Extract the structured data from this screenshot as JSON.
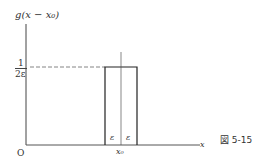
{
  "diagram": {
    "ylabel": "g(x − x₀)",
    "xlabel": "x",
    "origin": "O",
    "height_label_num": "1",
    "height_label_den": "2ε",
    "epsilon_left": "ε",
    "epsilon_right": "ε",
    "center_label": "x₀",
    "figure_caption": "図 5-15"
  }
}
